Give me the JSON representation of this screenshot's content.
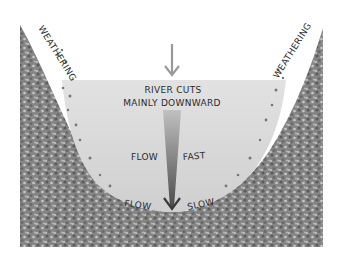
{
  "diagram": {
    "labels": {
      "weathering_left": "WEATHERING",
      "weathering_right": "WEATHERING",
      "main_line1": "RIVER CUTS",
      "main_line2": "MAINLY DOWNWARD",
      "flow_fast_left": "FLOW",
      "flow_fast_right": "FAST",
      "flow_slow_left": "FLOW",
      "flow_slow_right": "SLOW"
    },
    "colors": {
      "background": "#ffffff",
      "rock": "#8a8a8a",
      "rock_dark": "#5e5e5e",
      "rock_light": "#c4c4c4",
      "water": "#d9d9d9",
      "water_surface": "#e4e4e4",
      "arrow": "#9a9a9a",
      "velocity_dark": "#4a4a4a",
      "text": "#2b2b2b"
    }
  }
}
